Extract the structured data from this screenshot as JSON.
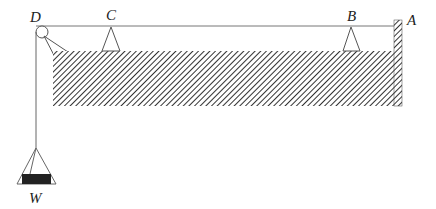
{
  "diagram": {
    "type": "physics-statics",
    "labels": {
      "D": "D",
      "C": "C",
      "B": "B",
      "A": "A",
      "W": "W"
    },
    "colors": {
      "line": "#555555",
      "hatch": "#333333",
      "weight": "#222222"
    }
  }
}
